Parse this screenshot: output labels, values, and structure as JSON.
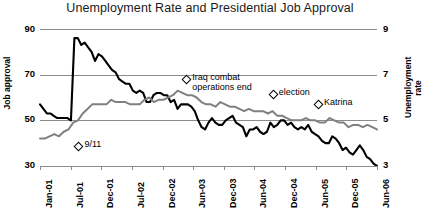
{
  "chart_data": {
    "type": "line",
    "title": "Unemployment Rate and Presidential Job Approval",
    "xlabel": "",
    "ylabel": "Job approval",
    "ylabel_right": "Unemployment rate",
    "grid": true,
    "legend": "none",
    "ylim": [
      30,
      90
    ],
    "ylim_right": [
      3,
      9
    ],
    "yticks": [
      "90",
      "70",
      "50",
      "30"
    ],
    "yticks_right": [
      "9",
      "7",
      "5",
      "3"
    ],
    "xlim": [
      "Jan-01",
      "Jun-06"
    ],
    "xticks": [
      "Jan-01",
      "Jul-01",
      "Dec-01",
      "Jul-02",
      "Dec-02",
      "Jun-03",
      "Dec-03",
      "Jun-04",
      "Dec-04",
      "Jun-05",
      "Dec-05",
      "Jun-06"
    ],
    "series": [
      {
        "name": "Job approval",
        "color": "#000000",
        "axis": "left",
        "values": [
          57,
          55,
          53,
          53,
          52,
          51,
          51,
          51,
          51,
          50,
          86,
          86,
          83,
          84,
          82,
          80,
          76,
          79,
          78,
          76,
          74,
          72,
          71,
          68,
          67,
          66,
          66,
          63,
          62,
          63,
          62,
          58,
          58,
          61,
          62,
          62,
          61,
          61,
          58,
          59,
          55,
          57,
          57,
          57,
          56,
          54,
          50,
          47,
          46,
          49,
          51,
          49,
          48,
          48,
          50,
          51,
          52,
          49,
          48,
          47,
          43,
          46,
          46,
          47,
          45,
          44,
          45,
          49,
          47,
          48,
          50,
          50,
          48,
          49,
          47,
          46,
          47,
          46,
          48,
          45,
          44,
          43,
          41,
          40,
          40,
          43,
          42,
          40,
          37,
          38,
          36,
          35,
          37,
          39,
          37,
          34,
          33,
          31,
          30
        ]
      },
      {
        "name": "Unemployment rate",
        "color": "#808080",
        "axis": "right",
        "values": [
          4.2,
          4.2,
          4.3,
          4.4,
          4.3,
          4.5,
          4.6,
          4.9,
          5.0,
          5.3,
          5.5,
          5.7,
          5.7,
          5.7,
          5.7,
          5.9,
          5.8,
          5.8,
          5.8,
          5.7,
          5.7,
          5.7,
          5.9,
          6.0,
          5.8,
          5.9,
          5.9,
          6.0,
          6.1,
          6.3,
          6.2,
          6.1,
          6.1,
          6.0,
          5.8,
          5.7,
          5.7,
          5.6,
          5.8,
          5.7,
          5.6,
          5.6,
          5.5,
          5.4,
          5.5,
          5.4,
          5.4,
          5.4,
          5.3,
          5.4,
          5.2,
          5.2,
          5.1,
          5.0,
          5.0,
          5.0,
          5.1,
          5.0,
          5.0,
          4.9,
          4.9,
          5.1,
          5.0,
          4.9,
          4.9,
          4.7,
          4.8,
          4.8,
          4.7,
          4.8,
          4.7,
          4.6
        ]
      }
    ],
    "annotations": [
      {
        "label": "9/11",
        "x_pct": 0.105,
        "y_px": 143
      },
      {
        "label": "Iraq combat operations end",
        "x_pct": 0.425,
        "y_px": 76
      },
      {
        "label": "election",
        "x_pct": 0.682,
        "y_px": 91
      },
      {
        "label": "Katrina",
        "x_pct": 0.816,
        "y_px": 101
      }
    ]
  }
}
